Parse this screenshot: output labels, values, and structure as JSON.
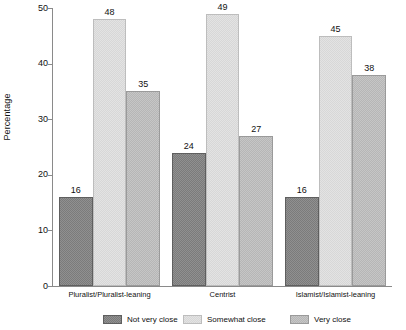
{
  "chart_data": {
    "type": "bar",
    "title": "",
    "subtitle": "",
    "xlabel": "",
    "ylabel": "Percentage",
    "ylim": [
      0,
      50
    ],
    "yticks": [
      0,
      10,
      20,
      30,
      40,
      50
    ],
    "ytick_labels": [
      "0",
      "10",
      "20",
      "30",
      "40",
      "50"
    ],
    "grid": false,
    "legend_position": "bottom",
    "categories": [
      "Pluralist/Pluralist-leaning",
      "Centrist",
      "Islamist/Islamist-leaning"
    ],
    "series": [
      {
        "name": "Not very close",
        "color": "#7b7b7b",
        "values": [
          16,
          24,
          16
        ],
        "labels": [
          "16",
          "24",
          "16"
        ]
      },
      {
        "name": "Somewhat close",
        "color": "#e3e3e3",
        "values": [
          48,
          49,
          45
        ],
        "labels": [
          "48",
          "49",
          "45"
        ]
      },
      {
        "name": "Very close",
        "color": "#b6b6b6",
        "values": [
          35,
          27,
          38
        ],
        "labels": [
          "35",
          "27",
          "38"
        ]
      }
    ]
  },
  "axis": {
    "y_title": "Percentage",
    "y_labels": [
      "50",
      "40",
      "30",
      "20",
      "10",
      "0"
    ]
  },
  "groups": [
    {
      "label": "Pluralist/Pluralist-leaning"
    },
    {
      "label": "Centrist"
    },
    {
      "label": "Islamist/Islamist-leaning"
    }
  ],
  "legend": {
    "items": [
      {
        "label": "Not very close",
        "swatch": "series-0-swatch"
      },
      {
        "label": "Somewhat close",
        "swatch": "series-1-swatch"
      },
      {
        "label": "Very close",
        "swatch": "series-2-swatch"
      }
    ]
  }
}
